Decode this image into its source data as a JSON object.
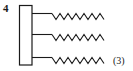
{
  "diagram": {
    "compound_number": "4",
    "chain_count_label": "(3)",
    "backbone": {
      "shape": "rectangle",
      "x": 19,
      "y": 5,
      "width": 13,
      "height": 60
    },
    "chains": [
      {
        "y": 13,
        "stem_start": 32,
        "stem_end": 52,
        "zigzag_end": 107
      },
      {
        "y": 34,
        "stem_start": 32,
        "stem_end": 52,
        "zigzag_end": 107
      },
      {
        "y": 57,
        "stem_start": 32,
        "stem_end": 52,
        "zigzag_end": 107
      }
    ],
    "stroke_color": "#1a1a1a"
  }
}
